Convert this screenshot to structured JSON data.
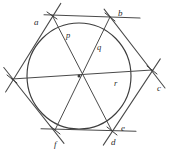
{
  "figure": {
    "background_color": "#ffffff",
    "stroke_color": "#4a4a4a",
    "circle_color": "#3d3d3d",
    "label_color": "#2b2b2b",
    "width": 176,
    "height": 156
  },
  "geometry": {
    "center": {
      "x": 79,
      "y": 76
    },
    "circle_radius": 52,
    "hexagon_vertices": [
      {
        "id": "v-top-left",
        "x": 52,
        "y": 15
      },
      {
        "id": "v-top-right",
        "x": 110,
        "y": 17
      },
      {
        "id": "v-right",
        "x": 152,
        "y": 70
      },
      {
        "id": "v-bottom-right",
        "x": 112,
        "y": 131
      },
      {
        "id": "v-bottom-left",
        "x": 55,
        "y": 130
      },
      {
        "id": "v-left",
        "x": 12,
        "y": 79
      }
    ],
    "diameters": [
      {
        "id": "diameter-p",
        "from": "v-top-left",
        "to": "v-bottom-right"
      },
      {
        "id": "diameter-q",
        "from": "v-top-right",
        "to": "v-bottom-left"
      },
      {
        "id": "diameter-r",
        "from": "v-left",
        "to": "v-right"
      }
    ]
  },
  "labels": {
    "vertex": [
      {
        "key": "a",
        "text": "a",
        "x": 34,
        "y": 18
      },
      {
        "key": "b",
        "text": "b",
        "x": 118,
        "y": 9
      },
      {
        "key": "c",
        "text": "c",
        "x": 157,
        "y": 84
      },
      {
        "key": "d",
        "text": "d",
        "x": 111,
        "y": 138
      },
      {
        "key": "e",
        "text": "e",
        "x": 121,
        "y": 124
      },
      {
        "key": "f",
        "text": "f",
        "x": 54,
        "y": 140
      }
    ],
    "radius": [
      {
        "key": "p",
        "text": "p",
        "x": 66,
        "y": 31
      },
      {
        "key": "q",
        "text": "q",
        "x": 97,
        "y": 43
      },
      {
        "key": "r",
        "text": "r",
        "x": 114,
        "y": 79
      }
    ]
  }
}
